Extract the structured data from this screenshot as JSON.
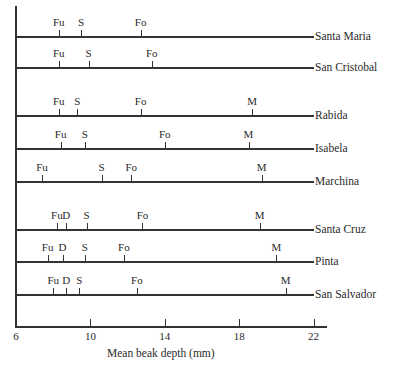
{
  "chart_data": {
    "type": "scatter",
    "title": "",
    "xlabel": "Mean beak depth (mm)",
    "ylabel": "",
    "xlim": [
      6,
      22
    ],
    "xticks": [
      6,
      10,
      14,
      18,
      22
    ],
    "grid": false,
    "legend": "none",
    "species_codes": [
      "Fu",
      "D",
      "S",
      "Fo",
      "M"
    ],
    "series": [
      {
        "name": "Santa Maria",
        "points": [
          {
            "label": "Fu",
            "x": 8.3
          },
          {
            "label": "S",
            "x": 9.5
          },
          {
            "label": "Fo",
            "x": 12.7
          }
        ]
      },
      {
        "name": "San Cristobal",
        "points": [
          {
            "label": "Fu",
            "x": 8.3
          },
          {
            "label": "S",
            "x": 9.9
          },
          {
            "label": "Fo",
            "x": 13.3
          }
        ]
      },
      {
        "name": "Rabida",
        "points": [
          {
            "label": "Fu",
            "x": 8.3
          },
          {
            "label": "S",
            "x": 9.3
          },
          {
            "label": "Fo",
            "x": 12.7
          },
          {
            "label": "M",
            "x": 18.7
          }
        ]
      },
      {
        "name": "Isabela",
        "points": [
          {
            "label": "Fu",
            "x": 8.4
          },
          {
            "label": "S",
            "x": 9.7
          },
          {
            "label": "Fo",
            "x": 14.0
          },
          {
            "label": "M",
            "x": 18.5
          }
        ]
      },
      {
        "name": "Marchina",
        "points": [
          {
            "label": "Fu",
            "x": 7.4
          },
          {
            "label": "S",
            "x": 10.6
          },
          {
            "label": "Fo",
            "x": 12.2
          },
          {
            "label": "M",
            "x": 19.2
          }
        ]
      },
      {
        "name": "Santa Cruz",
        "points": [
          {
            "label": "Fu",
            "x": 8.2
          },
          {
            "label": "D",
            "x": 8.7
          },
          {
            "label": "S",
            "x": 9.8
          },
          {
            "label": "Fo",
            "x": 12.8
          },
          {
            "label": "M",
            "x": 19.1
          }
        ]
      },
      {
        "name": "Pinta",
        "points": [
          {
            "label": "Fu",
            "x": 7.7
          },
          {
            "label": "D",
            "x": 8.5
          },
          {
            "label": "S",
            "x": 9.7
          },
          {
            "label": "Fo",
            "x": 11.8
          },
          {
            "label": "M",
            "x": 20.0
          }
        ]
      },
      {
        "name": "San Salvador",
        "points": [
          {
            "label": "Fu",
            "x": 8.0
          },
          {
            "label": "D",
            "x": 8.7
          },
          {
            "label": "S",
            "x": 9.4
          },
          {
            "label": "Fo",
            "x": 12.5
          },
          {
            "label": "M",
            "x": 20.5
          }
        ]
      }
    ]
  },
  "layout": {
    "row_y": [
      36,
      67,
      115,
      148,
      181,
      229,
      261,
      294
    ],
    "x_origin_px": 16,
    "px_per_mm": 18.6,
    "line_end_px": 314
  }
}
